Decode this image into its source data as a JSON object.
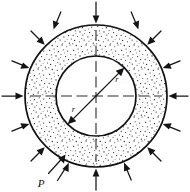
{
  "figure": {
    "type": "engineering-cross-section-diagram",
    "background_color": "#ffffff",
    "line_color": "#111111",
    "hatch_color": "#2a2a2a",
    "geometry": {
      "center_x": 96,
      "center_y": 96,
      "outer_radius": 71,
      "inner_radius": 40,
      "wall_fill": "stipple"
    },
    "labels": {
      "pressure": "P",
      "outer_radius_label": "r",
      "inner_radius_label": "r"
    },
    "centerlines": {
      "horizontal": true,
      "vertical": true,
      "style": "dashed"
    },
    "load": {
      "name": "external-pressure",
      "symbol": "P",
      "direction": "inward-radial",
      "arrow_count": 16,
      "arrow_angles_deg": [
        0,
        22.5,
        45,
        67.5,
        90,
        112.5,
        135,
        157.5,
        180,
        202.5,
        225,
        247.5,
        270,
        292.5,
        315,
        337.5
      ]
    },
    "dimensions": [
      {
        "name": "inner-radius-dimension",
        "label": "r",
        "from": "center",
        "to": "inner-circle",
        "angle_deg": 225
      },
      {
        "name": "outer-radius-dimension",
        "label": "r",
        "from": "center",
        "to": "inner-circle",
        "angle_deg": 45
      }
    ]
  }
}
